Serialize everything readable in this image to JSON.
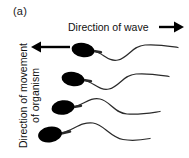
{
  "figure": {
    "panel_label": "(a)",
    "background_color": "#ffffff",
    "ink_color": "#000000"
  },
  "labels": {
    "wave_direction": "Direction of wave",
    "organism_direction_line1": "Direction of movement",
    "organism_direction_line2": "of organism"
  },
  "arrows": [
    {
      "name": "wave-direction-arrow",
      "direction": "right",
      "tail_x": 160,
      "head_x": 182,
      "y": 27
    },
    {
      "name": "organism-direction-arrow",
      "direction": "left",
      "tail_x": 70,
      "head_x": 33,
      "y": 47
    }
  ],
  "organisms": [
    {
      "name": "organism-1",
      "head_cx": 83,
      "head_cy": 50,
      "head_rx": 11,
      "head_ry": 7,
      "tail_path": "M 94 51 C 104 53 108 62 118 60 C 128 58 132 46 145 45 C 158 44 168 46 178 47",
      "neck_path": "M 92 50 L 100 52"
    },
    {
      "name": "organism-2",
      "head_cx": 73,
      "head_cy": 79,
      "head_rx": 11,
      "head_ry": 7,
      "tail_path": "M 84 80 C 94 82 99 91 109 89 C 119 87 123 75 136 74 C 149 73 159 75 169 76",
      "neck_path": "M 82 79 L 90 81"
    },
    {
      "name": "organism-3",
      "head_cx": 63,
      "head_cy": 107,
      "head_rx": 11,
      "head_ry": 7,
      "tail_path": "M 74 107 C 84 105 90 97 100 99 C 110 101 114 113 127 114 C 140 115 150 113 160 112",
      "neck_path": "M 72 107 L 80 105"
    },
    {
      "name": "organism-4",
      "head_cx": 50,
      "head_cy": 134,
      "head_rx": 12,
      "head_ry": 8,
      "tail_path": "M 62 133 C 74 130 82 122 93 123 C 104 124 110 136 123 139 C 134 141 142 140 150 139",
      "neck_path": "M 60 133 L 70 131"
    }
  ]
}
